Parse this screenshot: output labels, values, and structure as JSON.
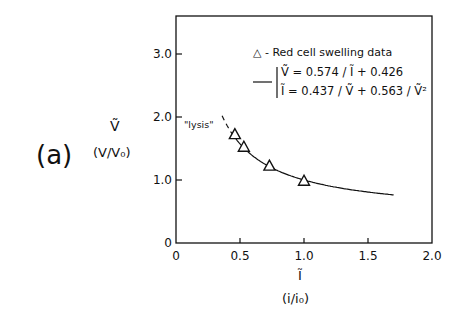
{
  "panel_label": "(a)",
  "y_axis": {
    "symbol": "Ṽ",
    "label": "(V/V₀)",
    "ticks": [
      "0",
      "1.0",
      "2.0",
      "3.0"
    ],
    "tick_values": [
      0,
      1,
      2,
      3
    ]
  },
  "x_axis": {
    "symbol": "Ĩ",
    "label": "(i/i₀)",
    "ticks": [
      "0",
      "0.5",
      "1.0",
      "1.5",
      "2.0"
    ],
    "tick_values": [
      0,
      0.5,
      1.0,
      1.5,
      2.0
    ]
  },
  "legend": {
    "marker_entry": "△  -  Red cell swelling data",
    "line_eq1": "Ṽ = 0.574 / Ĩ + 0.426",
    "line_eq2": "Ĩ = 0.437 / Ṽ + 0.563 / Ṽ²"
  },
  "annotation": "\"lysis\"",
  "chart_data": {
    "type": "scatter",
    "title": "",
    "xlabel": "Ĩ (i/i₀)",
    "ylabel": "Ṽ (V/V₀)",
    "xlim": [
      0,
      2.0
    ],
    "ylim": [
      0,
      3.5
    ],
    "grid": false,
    "legend_position": "upper right",
    "series": [
      {
        "name": "Red cell swelling data",
        "marker": "triangle",
        "x": [
          0.46,
          0.53,
          0.73,
          1.0
        ],
        "y": [
          1.72,
          1.52,
          1.22,
          0.98
        ]
      },
      {
        "name": "Ṽ = 0.574/Ĩ + 0.426",
        "type": "line",
        "x_range": [
          0.36,
          1.7
        ],
        "dashed_below_x": 0.45,
        "function": "0.574/x + 0.426"
      }
    ],
    "annotations": [
      {
        "text": "\"lysis\"",
        "x": 0.12,
        "y": 1.88
      }
    ]
  }
}
